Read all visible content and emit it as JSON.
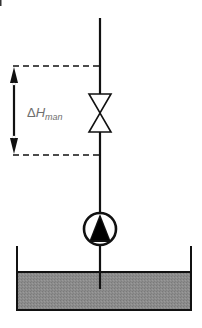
{
  "diagram": {
    "type": "pump-valve-tank schematic",
    "label": {
      "delta_symbol": "Δ",
      "variable": "H",
      "subscript": "man"
    },
    "components": [
      {
        "name": "vertical-pipe",
        "kind": "pipe"
      },
      {
        "name": "valve",
        "kind": "gate/globe valve (bowtie symbol)"
      },
      {
        "name": "pump",
        "kind": "centrifugal pump symbol (circle with triangle)"
      },
      {
        "name": "tank",
        "kind": "open tank with liquid"
      },
      {
        "name": "head-dimension",
        "kind": "double-headed arrow with dashed reference lines"
      }
    ],
    "colors": {
      "line": "#111111",
      "liquid": "#8a8a8a",
      "label": "#6e6e6e",
      "background": "#ffffff"
    }
  }
}
